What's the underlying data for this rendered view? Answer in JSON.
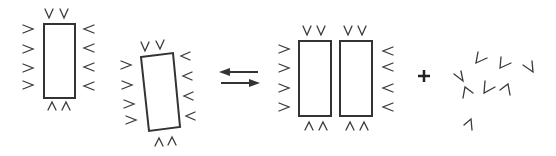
{
  "diagram": {
    "title": "",
    "description": "Two monomeric rectangles, each surrounded by V-shaped chevrons, in reversible equilibrium with a dimer of two rectangles plus released free chevrons",
    "colors": {
      "stroke": "#333333",
      "background": "#ffffff"
    },
    "nodes": [
      {
        "id": "monomer-1",
        "shape": "rectangle",
        "orientation": "upright",
        "bound_chevrons": 12
      },
      {
        "id": "monomer-2",
        "shape": "rectangle",
        "orientation": "tilted",
        "bound_chevrons": 12
      },
      {
        "id": "dimer",
        "shape": "two-rectangles",
        "bound_chevrons": 16
      },
      {
        "id": "released-chevrons",
        "shape": "scattered-chevrons",
        "count": 8
      }
    ],
    "operators": [
      {
        "id": "equilibrium",
        "symbol": "⇄"
      },
      {
        "id": "plus",
        "symbol": "+"
      }
    ]
  }
}
